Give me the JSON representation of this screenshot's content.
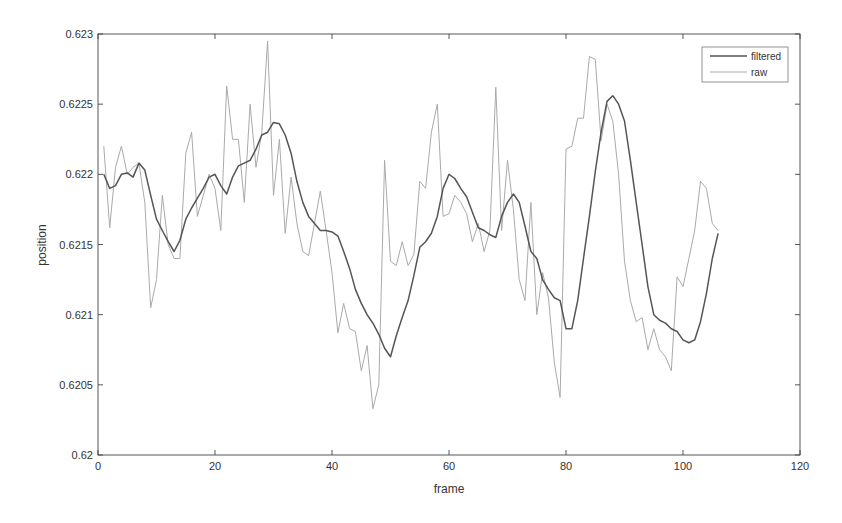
{
  "chart_data": {
    "type": "line",
    "title": "",
    "xlabel": "frame",
    "ylabel": "position",
    "xlim": [
      0,
      120
    ],
    "ylim": [
      0.62,
      0.623
    ],
    "xticks": [
      "0",
      "20",
      "40",
      "60",
      "80",
      "100",
      "120"
    ],
    "yticks": [
      "0.62",
      "0.6205",
      "0.621",
      "0.6215",
      "0.622",
      "0.6225",
      "0.623"
    ],
    "grid": false,
    "legend_position": "top-right",
    "series": [
      {
        "name": "filtered",
        "color": "#555555",
        "x": [
          1,
          2,
          3,
          4,
          5,
          6,
          7,
          8,
          9,
          10,
          11,
          12,
          13,
          14,
          15,
          16,
          17,
          18,
          19,
          20,
          21,
          22,
          23,
          24,
          25,
          26,
          27,
          28,
          29,
          30,
          31,
          32,
          33,
          34,
          35,
          36,
          37,
          38,
          39,
          40,
          41,
          42,
          43,
          44,
          45,
          46,
          47,
          48,
          49,
          50,
          51,
          52,
          53,
          54,
          55,
          56,
          57,
          58,
          59,
          60,
          61,
          62,
          63,
          64,
          65,
          66,
          67,
          68,
          69,
          70,
          71,
          72,
          73,
          74,
          75,
          76,
          77,
          78,
          79,
          80,
          81,
          82,
          83,
          84,
          85,
          86,
          87,
          88,
          89,
          90,
          91,
          92,
          93,
          94,
          95,
          96,
          97,
          98,
          99,
          100,
          101,
          102,
          103,
          104,
          105,
          106
        ],
        "values": [
          0.622,
          0.6219,
          0.62192,
          0.622,
          0.62201,
          0.62198,
          0.62208,
          0.62203,
          0.62185,
          0.62168,
          0.6216,
          0.62152,
          0.62145,
          0.62153,
          0.62168,
          0.62176,
          0.62183,
          0.6219,
          0.62198,
          0.622,
          0.62192,
          0.62186,
          0.62198,
          0.62206,
          0.62208,
          0.6221,
          0.62218,
          0.62228,
          0.6223,
          0.62237,
          0.62236,
          0.62228,
          0.62215,
          0.62195,
          0.6218,
          0.6217,
          0.62165,
          0.6216,
          0.6216,
          0.62159,
          0.62156,
          0.62145,
          0.62133,
          0.62118,
          0.62108,
          0.621,
          0.62094,
          0.62086,
          0.62076,
          0.6207,
          0.62085,
          0.62098,
          0.6211,
          0.62128,
          0.62148,
          0.62152,
          0.62158,
          0.6217,
          0.6219,
          0.622,
          0.62197,
          0.6219,
          0.62184,
          0.62173,
          0.62162,
          0.6216,
          0.62157,
          0.62155,
          0.6217,
          0.6218,
          0.62186,
          0.6218,
          0.62163,
          0.62145,
          0.6214,
          0.62125,
          0.62118,
          0.62112,
          0.6211,
          0.6209,
          0.6209,
          0.6211,
          0.6214,
          0.6217,
          0.62202,
          0.6223,
          0.62252,
          0.62256,
          0.6225,
          0.62238,
          0.6221,
          0.6218,
          0.6215,
          0.6212,
          0.621,
          0.62096,
          0.62094,
          0.6209,
          0.62088,
          0.62082,
          0.6208,
          0.62082,
          0.62095,
          0.62115,
          0.6214,
          0.62158
        ]
      },
      {
        "name": "raw",
        "color": "#aaaaaa",
        "x": [
          1,
          2,
          3,
          4,
          5,
          6,
          7,
          8,
          9,
          10,
          11,
          12,
          13,
          14,
          15,
          16,
          17,
          18,
          19,
          20,
          21,
          22,
          23,
          24,
          25,
          26,
          27,
          28,
          29,
          30,
          31,
          32,
          33,
          34,
          35,
          36,
          37,
          38,
          39,
          40,
          41,
          42,
          43,
          44,
          45,
          46,
          47,
          48,
          49,
          50,
          51,
          52,
          53,
          54,
          55,
          56,
          57,
          58,
          59,
          60,
          61,
          62,
          63,
          64,
          65,
          66,
          67,
          68,
          69,
          70,
          71,
          72,
          73,
          74,
          75,
          76,
          77,
          78,
          79,
          80,
          81,
          82,
          83,
          84,
          85,
          86,
          87,
          88,
          89,
          90,
          91,
          92,
          93,
          94,
          95,
          96,
          97,
          98,
          99,
          100,
          101,
          102,
          103,
          104,
          105,
          106
        ],
        "values": [
          0.6222,
          0.62162,
          0.62205,
          0.6222,
          0.622,
          0.62205,
          0.62208,
          0.6218,
          0.62105,
          0.62125,
          0.62185,
          0.6215,
          0.6214,
          0.6214,
          0.62215,
          0.6223,
          0.6217,
          0.62185,
          0.622,
          0.6219,
          0.6216,
          0.62263,
          0.62225,
          0.62225,
          0.6218,
          0.6225,
          0.62205,
          0.6223,
          0.62295,
          0.62185,
          0.62225,
          0.62158,
          0.62198,
          0.62165,
          0.62145,
          0.62142,
          0.62165,
          0.62188,
          0.6216,
          0.6213,
          0.62087,
          0.62108,
          0.6209,
          0.62088,
          0.6206,
          0.62078,
          0.62033,
          0.6205,
          0.6221,
          0.62138,
          0.62135,
          0.62152,
          0.62135,
          0.62143,
          0.62195,
          0.6219,
          0.6223,
          0.6225,
          0.6217,
          0.62172,
          0.62185,
          0.6218,
          0.62172,
          0.62152,
          0.62165,
          0.62145,
          0.6216,
          0.62262,
          0.6216,
          0.6221,
          0.62175,
          0.62125,
          0.6211,
          0.6218,
          0.621,
          0.6213,
          0.62112,
          0.62066,
          0.62041,
          0.62218,
          0.6222,
          0.6224,
          0.6224,
          0.62284,
          0.62282,
          0.62224,
          0.6225,
          0.62238,
          0.622,
          0.62138,
          0.6211,
          0.62095,
          0.62098,
          0.62075,
          0.6209,
          0.62075,
          0.6207,
          0.6206,
          0.62127,
          0.6212,
          0.6214,
          0.6216,
          0.62195,
          0.6219,
          0.62165,
          0.6216
        ]
      }
    ]
  },
  "legend": {
    "items": [
      {
        "label": "filtered"
      },
      {
        "label": "raw"
      }
    ]
  },
  "axes": {
    "xlabel": "frame",
    "ylabel": "position"
  }
}
